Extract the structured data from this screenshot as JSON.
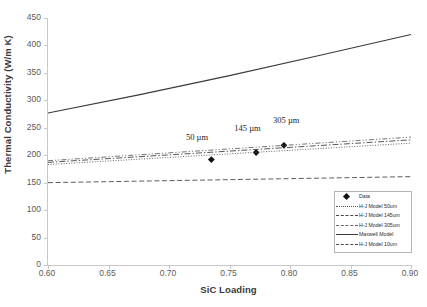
{
  "chart_data": {
    "type": "line",
    "title": "",
    "xlabel": "SiC Loading",
    "ylabel": "Thermal Conductivity (W/m K)",
    "xlim": [
      0.6,
      0.9
    ],
    "ylim": [
      0,
      450
    ],
    "xticks": [
      "0.60",
      "0.65",
      "0.70",
      "0.75",
      "0.80",
      "0.85",
      "0.90"
    ],
    "xtick_values": [
      0.6,
      0.65,
      0.7,
      0.75,
      0.8,
      0.85,
      0.9
    ],
    "yticks": [
      "0",
      "50",
      "100",
      "150",
      "200",
      "250",
      "300",
      "350",
      "400",
      "450"
    ],
    "ytick_values": [
      0,
      50,
      100,
      150,
      200,
      250,
      300,
      350,
      400,
      450
    ],
    "grid": false,
    "legend_position": "lower right",
    "series": [
      {
        "name": "Data",
        "style": "marker",
        "marker": "diamond",
        "color": "#111111",
        "x": [
          0.735,
          0.772,
          0.795
        ],
        "values": [
          192,
          205,
          218
        ]
      },
      {
        "name": "H-J Model 50um",
        "style": "dotted",
        "color": "#555555",
        "x": [
          0.6,
          0.9
        ],
        "values": [
          183,
          222
        ]
      },
      {
        "name": "H-J Model 145um",
        "style": "dash-dot",
        "color": "#444444",
        "x": [
          0.6,
          0.9
        ],
        "values": [
          187,
          228
        ]
      },
      {
        "name": "H-J Model 305um",
        "style": "dash-dot-dot",
        "color": "#666666",
        "x": [
          0.6,
          0.9
        ],
        "values": [
          190,
          233
        ]
      },
      {
        "name": "Maxwell Model",
        "style": "solid",
        "color": "#3a3a3a",
        "x": [
          0.6,
          0.675,
          0.75,
          0.825,
          0.9
        ],
        "values": [
          277,
          310,
          345,
          382,
          420
        ]
      },
      {
        "name": "H-J Model 10um",
        "style": "dashed",
        "color": "#4a4a4a",
        "x": [
          0.6,
          0.9
        ],
        "values": [
          150,
          161
        ]
      }
    ],
    "annotations": [
      {
        "text": "50 µm",
        "x": 0.728,
        "y": 232
      },
      {
        "text": "145 µm",
        "x": 0.768,
        "y": 247
      },
      {
        "text": "305 µm",
        "x": 0.8,
        "y": 262
      }
    ]
  },
  "legend": {
    "items": [
      "Data",
      "H-J Model 50um",
      "H-J Model 145um",
      "H-J Model 305um",
      "Maxwell Model",
      "H-J Model 10um"
    ]
  }
}
